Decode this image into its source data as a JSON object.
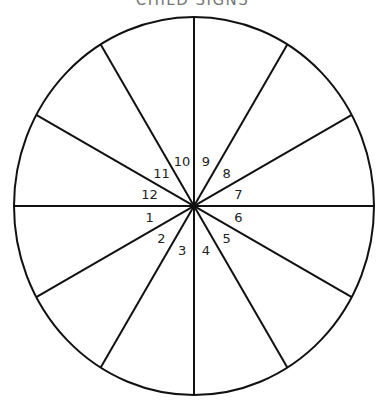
{
  "title": "CHILD SIGNS",
  "diagram": {
    "type": "wheel",
    "segments": 12,
    "line_color": "#111111",
    "background": "#ffffff",
    "labels": [
      {
        "n": "1",
        "angle": 195
      },
      {
        "n": "2",
        "angle": 225
      },
      {
        "n": "3",
        "angle": 255
      },
      {
        "n": "4",
        "angle": 285
      },
      {
        "n": "5",
        "angle": 315
      },
      {
        "n": "6",
        "angle": 345
      },
      {
        "n": "7",
        "angle": 15
      },
      {
        "n": "8",
        "angle": 45
      },
      {
        "n": "9",
        "angle": 75
      },
      {
        "n": "10",
        "angle": 105
      },
      {
        "n": "11",
        "angle": 135
      },
      {
        "n": "12",
        "angle": 165
      }
    ]
  }
}
